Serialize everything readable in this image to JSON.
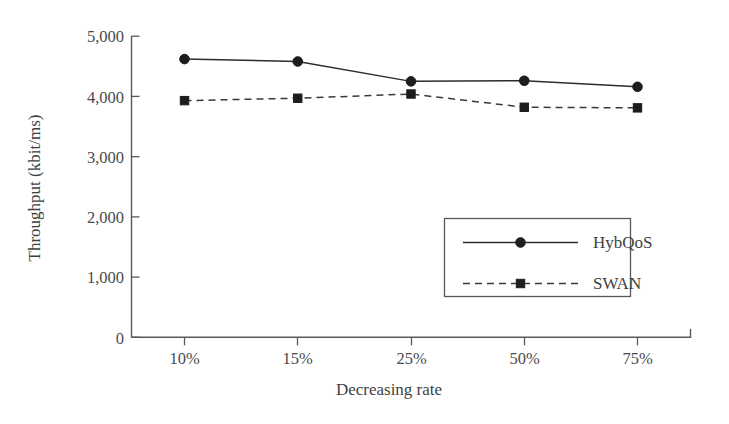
{
  "chart_data": {
    "type": "line",
    "title": "",
    "xlabel": "Decreasing rate",
    "ylabel": "Throughput (kbit/ms)",
    "categories": [
      "10%",
      "15%",
      "25%",
      "50%",
      "75%"
    ],
    "ytick_labels": [
      "0",
      "1,000",
      "2,000",
      "3,000",
      "4,000",
      "5,000"
    ],
    "ytick_values": [
      0,
      1000,
      2000,
      3000,
      4000,
      5000
    ],
    "ylim": [
      0,
      5000
    ],
    "grid": false,
    "legend_position": "center-right-inside",
    "series": [
      {
        "name": "HybQoS",
        "values": [
          4620,
          4580,
          4250,
          4260,
          4160
        ],
        "line_style": "solid",
        "marker": "circle",
        "color": "#1d1d1f"
      },
      {
        "name": "SWAN",
        "values": [
          3930,
          3970,
          4040,
          3820,
          3810
        ],
        "line_style": "dashed",
        "marker": "square",
        "color": "#1d1d1f"
      }
    ]
  }
}
